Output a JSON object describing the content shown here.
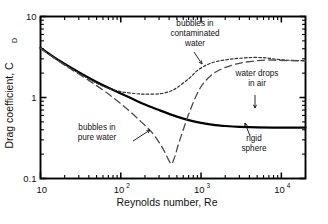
{
  "chart_data": {
    "type": "line",
    "title": "",
    "xlabel": "Reynolds number, Re",
    "ylabel": "Drag coefficient, C",
    "ylabel_sub": "D",
    "xscale": "log",
    "yscale": "log",
    "xlim": [
      10,
      20000
    ],
    "ylim": [
      0.1,
      10
    ],
    "grid": false,
    "legend": "inline-annotations",
    "xticks": [
      {
        "value": 10,
        "label": "10",
        "sup": ""
      },
      {
        "value": 100,
        "label": "10",
        "sup": "2"
      },
      {
        "value": 1000,
        "label": "10",
        "sup": "3"
      },
      {
        "value": 10000,
        "label": "10",
        "sup": "4"
      }
    ],
    "yticks": [
      {
        "value": 10,
        "label": "10"
      },
      {
        "value": 1,
        "label": "1"
      },
      {
        "value": 0.1,
        "label": "0.1"
      }
    ],
    "series": [
      {
        "name": "rigid sphere",
        "style": "solid",
        "color": "#000000",
        "width": 2.2,
        "points": [
          [
            10,
            4.1
          ],
          [
            15,
            3.1
          ],
          [
            20,
            2.6
          ],
          [
            30,
            2.05
          ],
          [
            50,
            1.55
          ],
          [
            70,
            1.32
          ],
          [
            100,
            1.12
          ],
          [
            150,
            0.93
          ],
          [
            200,
            0.82
          ],
          [
            300,
            0.7
          ],
          [
            500,
            0.58
          ],
          [
            700,
            0.525
          ],
          [
            1000,
            0.485
          ],
          [
            1500,
            0.455
          ],
          [
            2000,
            0.445
          ],
          [
            3000,
            0.435
          ],
          [
            5000,
            0.428
          ],
          [
            10000,
            0.425
          ],
          [
            20000,
            0.425
          ]
        ]
      },
      {
        "name": "bubbles in contaminated water",
        "style": "dotted",
        "color": "#333333",
        "width": 1.2,
        "points": [
          [
            10,
            4.05
          ],
          [
            15,
            3.05
          ],
          [
            20,
            2.55
          ],
          [
            30,
            2.0
          ],
          [
            50,
            1.5
          ],
          [
            70,
            1.3
          ],
          [
            100,
            1.18
          ],
          [
            150,
            1.12
          ],
          [
            200,
            1.1
          ],
          [
            300,
            1.11
          ],
          [
            400,
            1.18
          ],
          [
            500,
            1.32
          ],
          [
            700,
            1.7
          ],
          [
            900,
            2.15
          ],
          [
            1200,
            2.55
          ],
          [
            1600,
            2.8
          ],
          [
            2200,
            2.95
          ],
          [
            3000,
            3.05
          ],
          [
            4500,
            3.12
          ],
          [
            6500,
            3.08
          ],
          [
            9000,
            2.95
          ],
          [
            13000,
            2.88
          ],
          [
            20000,
            2.85
          ]
        ]
      },
      {
        "name": "bubbles in pure water",
        "style": "dashed",
        "color": "#4a4a4a",
        "width": 1.3,
        "points": [
          [
            10,
            4.05
          ],
          [
            20,
            2.5
          ],
          [
            30,
            1.95
          ],
          [
            50,
            1.4
          ],
          [
            80,
            1.0
          ],
          [
            120,
            0.72
          ],
          [
            180,
            0.5
          ],
          [
            250,
            0.36
          ],
          [
            330,
            0.24
          ],
          [
            400,
            0.165
          ],
          [
            430,
            0.152
          ],
          [
            470,
            0.185
          ],
          [
            520,
            0.26
          ],
          [
            600,
            0.4
          ],
          [
            700,
            0.62
          ],
          [
            820,
            0.92
          ],
          [
            950,
            1.25
          ],
          [
            1100,
            1.55
          ],
          [
            1400,
            1.95
          ],
          [
            1800,
            2.25
          ],
          [
            2400,
            2.5
          ],
          [
            3200,
            2.68
          ],
          [
            4500,
            2.82
          ],
          [
            6500,
            2.9
          ],
          [
            9000,
            2.88
          ],
          [
            13000,
            2.85
          ],
          [
            20000,
            2.83
          ]
        ]
      }
    ],
    "annotations": [
      {
        "id": "contaminated",
        "lines": [
          "bubbles in",
          "contaminated",
          "water"
        ],
        "text_anchor": "middle",
        "x_px": 195,
        "y_px": 26,
        "leader": {
          "x1": 194,
          "y1": 52,
          "x2": 202,
          "y2": 64
        }
      },
      {
        "id": "water-drops",
        "lines": [
          "water drops",
          "in air"
        ],
        "text_anchor": "middle",
        "x_px": 257,
        "y_px": 76,
        "leader": {
          "x1": 255,
          "y1": 95,
          "x2": 255,
          "y2": 108
        }
      },
      {
        "id": "pure-water",
        "lines": [
          "bubbles in",
          "pure water"
        ],
        "text_anchor": "middle",
        "x_px": 97,
        "y_px": 130,
        "leader": {
          "x1": 133,
          "y1": 141,
          "x2": 150,
          "y2": 130
        }
      },
      {
        "id": "rigid-sphere",
        "lines": [
          "rigid",
          "sphere"
        ],
        "text_anchor": "middle",
        "x_px": 254,
        "y_px": 141,
        "leader": {
          "x1": 250,
          "y1": 136,
          "x2": 245,
          "y2": 123
        }
      }
    ]
  }
}
